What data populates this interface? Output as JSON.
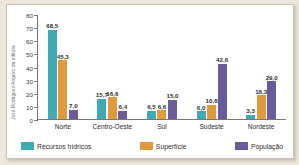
{
  "credit": "José Rodrigues/Arquivo da editora",
  "chart_data": {
    "type": "bar",
    "title": "",
    "xlabel": "",
    "ylabel": "",
    "ylim": [
      0,
      80
    ],
    "yticks": [
      "80",
      "70",
      "60",
      "50",
      "40",
      "30",
      "20",
      "10",
      "0"
    ],
    "grid": false,
    "legend_position": "bottom",
    "categories": [
      "Norte",
      "Centro-Oeste",
      "Sul",
      "Sudeste",
      "Nordeste"
    ],
    "series": [
      {
        "name": "Recursos hídricos",
        "color": "#3FA9B4",
        "values": [
          68.5,
          15.7,
          6.5,
          6.0,
          3.3
        ],
        "labels": [
          "68,5",
          "15,7",
          "6,5",
          "6,0",
          "3,3"
        ]
      },
      {
        "name": "Superfície",
        "color": "#E09A3C",
        "values": [
          45.3,
          16.6,
          6.6,
          10.8,
          18.3
        ],
        "labels": [
          "45,3",
          "16,6",
          "6,6",
          "10,8",
          "18,3"
        ]
      },
      {
        "name": "População",
        "color": "#6B5B9A",
        "values": [
          7.0,
          6.4,
          15.0,
          42.6,
          29.0
        ],
        "labels": [
          "7,0",
          "6,4",
          "15,0",
          "42,6",
          "29,0"
        ]
      }
    ]
  }
}
